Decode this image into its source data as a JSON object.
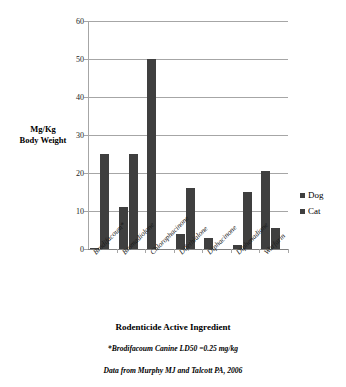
{
  "chart_data": {
    "type": "bar",
    "title": "",
    "xlabel": "Rodenticide Active Ingredient",
    "ylabel": "Mg/Kg Body Weight",
    "ylim": [
      0,
      60
    ],
    "ytick_step": 10,
    "yticks": [
      "0",
      "10",
      "20",
      "30",
      "40",
      "50",
      "60"
    ],
    "grid": true,
    "legend_position": "right",
    "categories": [
      "Brodifacoum*",
      "Bromadiolone",
      "Chlorophacinone",
      "Difethialone",
      "Diphacinone",
      "Diphenadione",
      "Warfarin"
    ],
    "series": [
      {
        "name": "Dog",
        "color": "#3f3f3f",
        "values": [
          0.25,
          11,
          50,
          4,
          3,
          1,
          20.5
        ]
      },
      {
        "name": "Cat",
        "color": "#3f3f3f",
        "values": [
          25,
          25,
          0,
          16,
          0,
          15,
          5.5
        ]
      }
    ],
    "annotations": [
      "*Brodifacoum  Canine LD50 =0.25 mg/kg",
      "Data from Murphy MJ and Talcott PA, 2006"
    ]
  },
  "axis": {
    "y_title_line1": "Mg/Kg",
    "y_title_line2": "Body Weight",
    "x_title": "Rodenticide Active Ingredient"
  },
  "legend": {
    "items": [
      {
        "label": "Dog"
      },
      {
        "label": "Cat"
      }
    ]
  },
  "captions": {
    "footnote": "*Brodifacoum  Canine LD50 =0.25 mg/kg",
    "source": "Data from Murphy MJ and Talcott PA, 2006"
  },
  "colors": {
    "bar": "#3f3f3f",
    "grid": "#a6a6a6",
    "text": "#000000",
    "background": "#ffffff"
  }
}
